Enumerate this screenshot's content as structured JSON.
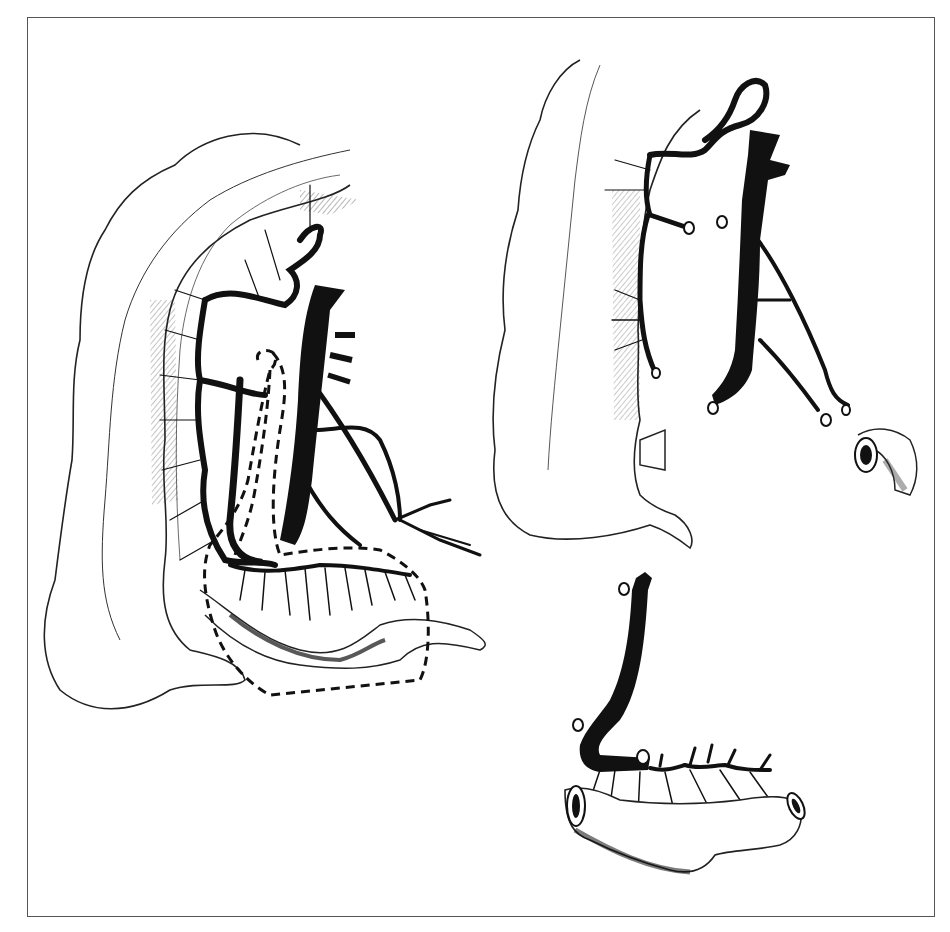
{
  "figure": {
    "type": "anatomical-illustration",
    "style": "black-and-white line drawing",
    "colors": {
      "ink": "#111111",
      "outline": "#222222",
      "frame": "#555555",
      "background": "#ffffff"
    },
    "panels": [
      {
        "id": "left",
        "depicts": "colon with mesenteric vascular arcades and dashed resection outline"
      },
      {
        "id": "top-right",
        "depicts": "colon with divided vascular pedicle and ligated vessel stumps, transected bowel end"
      },
      {
        "id": "bottom-right",
        "depicts": "isolated bowel segment on vascular pedicle with open ends"
      }
    ],
    "caption": ""
  }
}
